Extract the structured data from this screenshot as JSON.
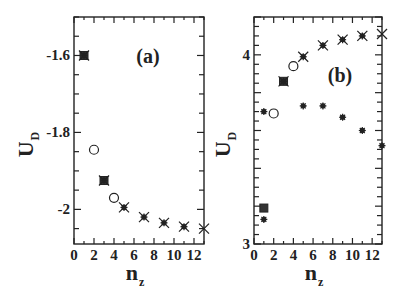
{
  "chart_data": [
    {
      "type": "scatter",
      "panel_label": "(a)",
      "xlabel": "n_z",
      "ylabel": "U_D",
      "xlim": [
        0,
        13
      ],
      "ylim": [
        -2.09,
        -1.5
      ],
      "xticks": [
        0,
        2,
        4,
        6,
        8,
        10,
        12
      ],
      "yticks": [
        -1.6,
        -1.8,
        -2.0
      ],
      "ytick_labels": [
        "-1.6",
        "-1.8",
        "-2"
      ],
      "grid": false,
      "series": [
        {
          "name": "squares",
          "marker": "square",
          "x": [
            1,
            3
          ],
          "y": [
            -1.6,
            -1.925
          ]
        },
        {
          "name": "crosses",
          "marker": "x",
          "x": [
            1,
            3,
            5,
            7,
            9,
            11,
            13
          ],
          "y": [
            -1.6,
            -1.925,
            -1.995,
            -2.02,
            -2.035,
            -2.045,
            -2.05
          ]
        },
        {
          "name": "asterisks",
          "marker": "asterisk",
          "x": [
            1,
            3,
            5,
            7,
            9,
            11
          ],
          "y": [
            -1.6,
            -1.925,
            -1.995,
            -2.02,
            -2.035,
            -2.045
          ]
        },
        {
          "name": "circles",
          "marker": "circle",
          "x": [
            2,
            4
          ],
          "y": [
            -1.845,
            -1.97
          ]
        }
      ]
    },
    {
      "type": "scatter",
      "panel_label": "(b)",
      "xlabel": "n_z",
      "ylabel": "U_D",
      "xlim": [
        0,
        13
      ],
      "ylim": [
        3.0,
        4.2
      ],
      "xticks": [
        0,
        2,
        4,
        6,
        8,
        10,
        12
      ],
      "yticks": [
        3,
        4
      ],
      "ytick_labels": [
        "3",
        "4"
      ],
      "grid": false,
      "series": [
        {
          "name": "squares",
          "marker": "square",
          "x": [
            1,
            3
          ],
          "y": [
            3.19,
            3.86
          ]
        },
        {
          "name": "crosses",
          "marker": "x",
          "x": [
            3,
            5,
            7,
            9,
            11,
            13
          ],
          "y": [
            3.86,
            3.99,
            4.05,
            4.08,
            4.1,
            4.11
          ]
        },
        {
          "name": "asterisks-upper",
          "marker": "asterisk",
          "x": [
            3,
            5,
            7,
            9,
            11
          ],
          "y": [
            3.86,
            3.99,
            4.05,
            4.08,
            4.1
          ]
        },
        {
          "name": "asterisks-lower",
          "marker": "asterisk",
          "x": [
            1,
            1,
            5,
            7,
            9,
            11,
            13
          ],
          "y": [
            3.13,
            3.7,
            3.73,
            3.73,
            3.67,
            3.6,
            3.52
          ]
        },
        {
          "name": "circles",
          "marker": "circle",
          "x": [
            2,
            4
          ],
          "y": [
            3.69,
            3.94
          ]
        }
      ]
    }
  ],
  "panels": [
    {
      "label": "(a)",
      "ylabel_main": "U",
      "ylabel_sub": "D",
      "xlabel_main": "n",
      "xlabel_sub": "z"
    },
    {
      "label": "(b)",
      "ylabel_main": "U",
      "ylabel_sub": "D",
      "xlabel_main": "n",
      "xlabel_sub": "z"
    }
  ]
}
